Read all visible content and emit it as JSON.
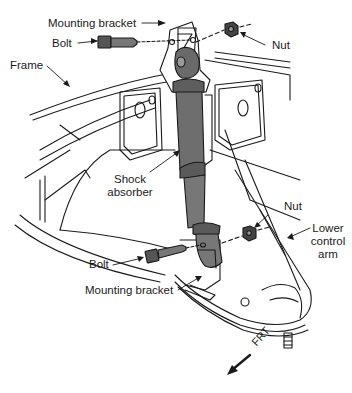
{
  "diagram": {
    "labels": {
      "top_bracket": "Mounting bracket",
      "top_bolt": "Bolt",
      "top_nut": "Nut",
      "frame": "Frame",
      "shock_line1": "Shock",
      "shock_line2": "absorber",
      "bottom_nut": "Nut",
      "lca_line1": "Lower",
      "lca_line2": "control",
      "lca_line3": "arm",
      "bottom_bolt": "Bolt",
      "bottom_bracket": "Mounting bracket",
      "direction": "FRT"
    },
    "colors": {
      "line": "#1a1a1a",
      "shock_body": "#6e6e6e",
      "shock_dark": "#555555",
      "background": "#ffffff"
    }
  }
}
